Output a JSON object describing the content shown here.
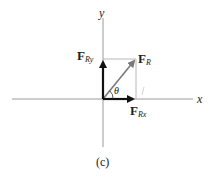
{
  "diagram": {
    "caption": "(c)",
    "axes": {
      "x_label": "x",
      "y_label": "y",
      "color": "#9a9a9a"
    },
    "vectors": {
      "resultant": {
        "symbol": "F",
        "subscript": "R",
        "color": "#7a7a7a"
      },
      "y_component": {
        "symbol": "F",
        "subscript": "Ry",
        "color": "#111111"
      },
      "x_component": {
        "symbol": "F",
        "subscript": "Rx",
        "color": "#111111"
      }
    },
    "angle_label": "θ",
    "rectangle_color": "#b8b8b8"
  }
}
